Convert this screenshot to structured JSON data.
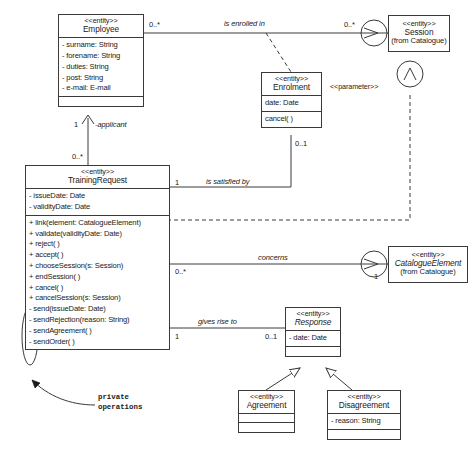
{
  "diagram": {
    "type": "uml-class-diagram",
    "stroke_color": "#3a3a3a",
    "background": "#ffffff"
  },
  "classes": {
    "employee": {
      "stereotype": "<<entity>>",
      "name": "Employee",
      "attributes": [
        "- surname: String",
        "- forename: String",
        "- duties: String",
        "- post: String",
        "- e-mail: E-mail"
      ],
      "operations": []
    },
    "session": {
      "stereotype": "<<entity>>",
      "name": "Session",
      "package": "(from Catalogue)",
      "attributes": [],
      "operations": []
    },
    "enrolment": {
      "stereotype": "<<entity>>",
      "name": "Enrolment",
      "attributes": [
        "date: Date"
      ],
      "operations": [
        "cancel( )"
      ]
    },
    "training_request": {
      "stereotype": "<<entity>>",
      "name": "TrainingRequest",
      "attributes": [
        "- issueDate: Date",
        "- validityDate: Date"
      ],
      "operations": [
        "+ link(element: CatalogueElement)",
        "+ validate(validityDate: Date)",
        "+ reject( )",
        "+ accept( )",
        "+ chooseSession(s: Session)",
        "+ endSession( )",
        "+ cancel( )",
        "+ cancelSession(s: Session)",
        "- send(issueDate: Date)",
        "- sendRejection(reason: String)",
        "- sendAgreement( )",
        "- sendOrder( )"
      ]
    },
    "catalogue_element": {
      "stereotype": "<<entity>>",
      "name": "CatalogueElement",
      "package": "(from Catalogue)",
      "abstract": true,
      "attributes": [],
      "operations": []
    },
    "response": {
      "stereotype": "<<entity>>",
      "name": "Response",
      "abstract": true,
      "attributes": [
        "- date: Date"
      ],
      "operations": []
    },
    "agreement": {
      "stereotype": "<<entity>>",
      "name": "Agreement",
      "attributes": [],
      "operations": []
    },
    "disagreement": {
      "stereotype": "<<entity>>",
      "name": "Disagreement",
      "attributes": [
        "- reason: String"
      ],
      "operations": []
    }
  },
  "associations": {
    "is_enrolled_in": {
      "label": "is enrolled in",
      "source_mult": "0..*",
      "target_mult": "0..*"
    },
    "is_satisfied_by": {
      "label": "is satisfied by",
      "source_mult": "1",
      "target_mult": "0..1"
    },
    "concerns": {
      "label": "concerns",
      "source_mult": "0..*",
      "target_mult": "1"
    },
    "gives_rise_to": {
      "label": "gives rise to",
      "source_mult": "1",
      "target_mult": "0..1"
    },
    "applicant": {
      "role": "-applicant",
      "source_mult": "0..*",
      "target_mult": "1"
    },
    "parameter": {
      "stereotype": "<<parameter>>"
    }
  },
  "annotations": {
    "private_operations": "private\noperations",
    "private_operations_line1": "private",
    "private_operations_line2": "operations"
  }
}
